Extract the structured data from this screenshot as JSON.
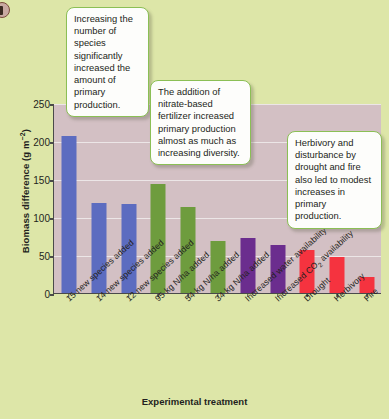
{
  "figure": {
    "panel_mark": "panel-label-partial"
  },
  "chart_data": {
    "type": "bar",
    "title": "",
    "xlabel": "Experimental treatment",
    "ylabel": "Biomass difference (g m⁻²)",
    "ylim": [
      0,
      250
    ],
    "yticks": [
      0,
      50,
      100,
      150,
      200,
      250
    ],
    "grid": true,
    "legend": "none",
    "categories": [
      "15 new species added",
      "14 new species added",
      "12 new species added",
      "95 kg N/ha added",
      "54 kg N/ha added",
      "34 kg N/ha added",
      "Increased water availability",
      "Increased CO2 availability",
      "Drought",
      "Herbivory",
      "Fire"
    ],
    "values": [
      206,
      119,
      117,
      143,
      113,
      69,
      72,
      63,
      56,
      48,
      21
    ],
    "colors": [
      "#5c6cc0",
      "#5c6cc0",
      "#5c6cc0",
      "#6e9c3e",
      "#6e9c3e",
      "#6e9c3e",
      "#6b2d8e",
      "#6b2d8e",
      "#f5333f",
      "#f5333f",
      "#f5333f"
    ],
    "group_labels": [
      "species diversity",
      "nitrogen fertilizer",
      "resource availability",
      "disturbance"
    ]
  },
  "axes": {
    "y_title_main": "Biomass difference (g m",
    "y_title_sup": "−2",
    "y_title_close": ")",
    "x_title": "Experimental treatment",
    "ytick_labels": [
      "250",
      "200",
      "150",
      "100",
      "50",
      "0"
    ]
  },
  "xtick_labels": [
    {
      "text_pre": "15 new species added",
      "sub": "",
      "text_post": ""
    },
    {
      "text_pre": "14 new species added",
      "sub": "",
      "text_post": ""
    },
    {
      "text_pre": "12 new species added",
      "sub": "",
      "text_post": ""
    },
    {
      "text_pre": "95 kg N/ha added",
      "sub": "",
      "text_post": ""
    },
    {
      "text_pre": "54 kg N/ha added",
      "sub": "",
      "text_post": ""
    },
    {
      "text_pre": "34 kg N/ha added",
      "sub": "",
      "text_post": ""
    },
    {
      "text_pre": "Increased water availability",
      "sub": "",
      "text_post": ""
    },
    {
      "text_pre": "Increased CO",
      "sub": "2",
      "text_post": " availability"
    },
    {
      "text_pre": "Drought",
      "sub": "",
      "text_post": ""
    },
    {
      "text_pre": "Herbivory",
      "sub": "",
      "text_post": ""
    },
    {
      "text_pre": "Fire",
      "sub": "",
      "text_post": ""
    }
  ],
  "callouts": [
    {
      "id": "callout-1",
      "text": "Increasing the number of species significantly increased the amount of primary production."
    },
    {
      "id": "callout-2",
      "text": "The addition of nitrate-based fertilizer increased primary production almost as much as increasing diversity."
    },
    {
      "id": "callout-3",
      "text": "Herbivory and disturbance by drought and fire also led to modest increases in primary production."
    }
  ],
  "colors": {
    "page_background": "#dde6a8",
    "plot_background": "#d3c0c4",
    "gridline": "#ece6e7",
    "axis": "#4a4a4a",
    "series_blue": "#5c6cc0",
    "series_green": "#6e9c3e",
    "series_purple": "#6b2d8e",
    "series_red": "#f5333f",
    "callout_border": "#8bbf55",
    "callout_fill": "#fdfdfb",
    "text": "#231f20"
  }
}
